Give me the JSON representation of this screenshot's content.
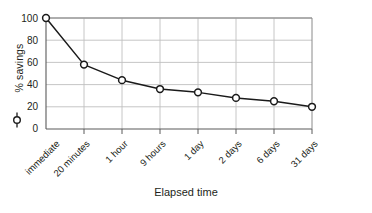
{
  "chart_data": {
    "type": "line",
    "title": "",
    "subtitle": "",
    "xlabel": "Elapsed time",
    "ylabel": "% savings",
    "categories": [
      "immediate",
      "20 minutes",
      "1 hour",
      "9 hours",
      "1 day",
      "2 days",
      "6 days",
      "31 days"
    ],
    "values": [
      100,
      58,
      44,
      36,
      33,
      28,
      25,
      20
    ],
    "series": [
      {
        "name": "% savings",
        "values": [
          100,
          58,
          44,
          36,
          33,
          28,
          25,
          20
        ]
      }
    ],
    "ylim": [
      0,
      100
    ],
    "yticks": [
      0,
      20,
      40,
      60,
      80,
      100
    ],
    "ytick_labels": [
      "0",
      "20",
      "40",
      "60",
      "80",
      "100"
    ],
    "grid": true,
    "grid_axis": "both",
    "legend": false,
    "legend_position": "none",
    "marker": "open-circle",
    "line_color": "#1a1a1a",
    "marker_fill": "#ffffff",
    "marker_edge": "#1a1a1a",
    "grid_color": "#b8b8b8",
    "axis_color": "#6e6e6e",
    "background": "#ffffff",
    "annotations": []
  },
  "axes": {
    "y_title": "% savings",
    "x_title": "Elapsed time",
    "y_marker_glyph": "open-circle-marker"
  },
  "y_tick_labels": [
    "100",
    "80",
    "60",
    "40",
    "20",
    "0"
  ],
  "x_tick_labels": [
    "immediate",
    "20 minutes",
    "1 hour",
    "9 hours",
    "1 day",
    "2 days",
    "6 days",
    "31 days"
  ]
}
